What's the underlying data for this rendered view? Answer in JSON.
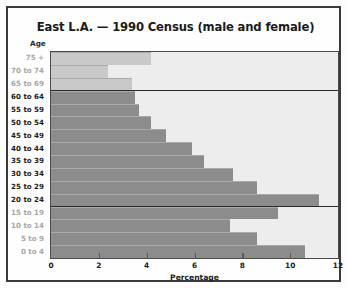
{
  "figure": {
    "title": "East L.A. — 1990 Census (male and female)",
    "y_axis_title": "Age",
    "x_axis_title": "Percentage",
    "colors": {
      "frame": "#3a3a3a",
      "plot_background": "#ededed",
      "bar_light": "#c9c9c9",
      "bar_mid": "#8c8c8c",
      "divider": "#2a2a2a",
      "label_bold": "#1c1c1c",
      "label_faint": "#a6a6a6"
    }
  },
  "chart_data": {
    "type": "bar",
    "orientation": "horizontal",
    "title": "East L.A. — 1990 Census (male and female)",
    "xlabel": "Percentage",
    "ylabel": "Age",
    "xlim": [
      0,
      12
    ],
    "xticks": [
      0,
      2,
      4,
      6,
      8,
      10,
      12
    ],
    "xtick_labels": [
      "0",
      "2",
      "4",
      "6",
      "8",
      "10",
      "12"
    ],
    "grid": false,
    "legend": null,
    "categories": [
      "75 +",
      "70 to 74",
      "65 to 69",
      "60 to 64",
      "55 to 59",
      "50 to 54",
      "45 to 49",
      "40 to 44",
      "35 to 39",
      "30 to 34",
      "25 to 29",
      "20 to 24",
      "15 to 19",
      "10 to 14",
      "5 to 9",
      "0 to 4"
    ],
    "values": [
      4.2,
      2.4,
      3.4,
      3.5,
      3.7,
      4.2,
      4.8,
      5.9,
      6.4,
      7.6,
      8.6,
      11.2,
      9.5,
      7.5,
      8.6,
      10.6
    ],
    "bar_styles": [
      "light",
      "light",
      "light",
      "mid",
      "mid",
      "mid",
      "mid",
      "mid",
      "mid",
      "mid",
      "mid",
      "mid",
      "mid",
      "mid",
      "mid",
      "mid"
    ],
    "label_styles": [
      "faint",
      "faint",
      "faint",
      "bold",
      "bold",
      "bold",
      "bold",
      "bold",
      "bold",
      "bold",
      "bold",
      "bold",
      "faint",
      "faint",
      "faint",
      "faint"
    ],
    "group_dividers_after": [
      "65 to 69",
      "20 to 24"
    ]
  }
}
